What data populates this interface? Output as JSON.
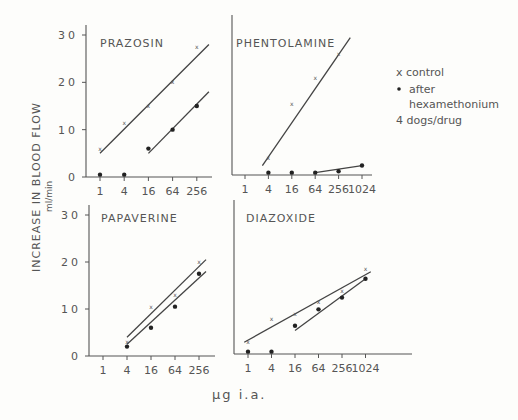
{
  "figure": {
    "y_axis_label": "INCREASE IN BLOOD FLOW",
    "y_axis_unit": "ml/min",
    "x_axis_label": "µg i.a.",
    "legend": {
      "control": "x control",
      "after_line1": "after",
      "after_line2": "hexamethonium",
      "note": "4 dogs/drug"
    },
    "y_ticks": [
      "0",
      "10",
      "20",
      "30"
    ]
  },
  "chart_data": [
    {
      "type": "scatter",
      "title": "PRAZOSIN",
      "xlabel": "µg i.a.",
      "ylabel": "INCREASE IN BLOOD FLOW ml/min",
      "x_scale": "log4",
      "categories": [
        "1",
        "4",
        "16",
        "64",
        "256"
      ],
      "ylim": [
        0,
        30
      ],
      "series": [
        {
          "name": "control",
          "marker": "x",
          "x": [
            1,
            4,
            16,
            64,
            256
          ],
          "values": [
            6,
            11.5,
            15,
            20,
            27.5
          ],
          "fit_line": {
            "from": [
              1,
              5
            ],
            "to": [
              512,
              28
            ]
          }
        },
        {
          "name": "after hexamethonium",
          "marker": "dot",
          "x": [
            1,
            4,
            16,
            64,
            256
          ],
          "values": [
            0.5,
            0.5,
            6,
            10,
            15
          ],
          "fit_line": {
            "from": [
              16,
              5
            ],
            "to": [
              512,
              18
            ]
          }
        }
      ]
    },
    {
      "type": "scatter",
      "title": "PHENTOLAMINE",
      "xlabel": "µg i.a.",
      "ylabel": "INCREASE IN BLOOD FLOW ml/min",
      "x_scale": "log4",
      "categories": [
        "1",
        "4",
        "16",
        "64",
        "256",
        "1024"
      ],
      "ylim": [
        0,
        30
      ],
      "series": [
        {
          "name": "control",
          "marker": "x",
          "x": [
            4,
            16,
            64,
            256
          ],
          "values": [
            3.5,
            15,
            20.5,
            25.5
          ],
          "fit_line": {
            "from": [
              2.8,
              2
            ],
            "to": [
              512,
              29
            ]
          }
        },
        {
          "name": "after hexamethonium",
          "marker": "dot",
          "x": [
            4,
            16,
            64,
            256,
            1024
          ],
          "values": [
            0.5,
            0.5,
            0.5,
            0.8,
            2
          ],
          "fit_line": {
            "from": [
              64,
              0.5
            ],
            "to": [
              1024,
              2
            ]
          }
        }
      ]
    },
    {
      "type": "scatter",
      "title": "PAPAVERINE",
      "xlabel": "µg i.a.",
      "ylabel": "INCREASE IN BLOOD FLOW ml/min",
      "x_scale": "log4",
      "categories": [
        "1",
        "4",
        "16",
        "64",
        "256"
      ],
      "ylim": [
        0,
        30
      ],
      "series": [
        {
          "name": "control",
          "marker": "x",
          "x": [
            4,
            16,
            64,
            256
          ],
          "values": [
            3,
            10.5,
            13,
            20
          ],
          "fit_line": {
            "from": [
              4,
              4
            ],
            "to": [
              384,
              20.5
            ]
          }
        },
        {
          "name": "after hexamethonium",
          "marker": "dot",
          "x": [
            4,
            16,
            64,
            256
          ],
          "values": [
            2,
            6,
            10.5,
            17.5
          ],
          "fit_line": {
            "from": [
              4,
              2.5
            ],
            "to": [
              384,
              18
            ]
          }
        }
      ]
    },
    {
      "type": "scatter",
      "title": "DIAZOXIDE",
      "xlabel": "µg i.a.",
      "ylabel": "INCREASE IN BLOOD FLOW ml/min",
      "x_scale": "log4",
      "categories": [
        "1",
        "4",
        "16",
        "64",
        "256",
        "1024"
      ],
      "ylim": [
        0,
        30
      ],
      "series": [
        {
          "name": "control",
          "marker": "x",
          "x": [
            1,
            4,
            16,
            64,
            256,
            1024
          ],
          "values": [
            2.5,
            7.5,
            8.5,
            11,
            13.5,
            18
          ],
          "fit_line": {
            "from": [
              0.8,
              2.5
            ],
            "to": [
              1400,
              17.5
            ]
          }
        },
        {
          "name": "after hexamethonium",
          "marker": "dot",
          "x": [
            1,
            4,
            16,
            64,
            256,
            1024
          ],
          "values": [
            0.5,
            0.5,
            6,
            9.5,
            12,
            16
          ],
          "fit_line": {
            "from": [
              16,
              5
            ],
            "to": [
              1024,
              16
            ]
          }
        }
      ]
    }
  ]
}
